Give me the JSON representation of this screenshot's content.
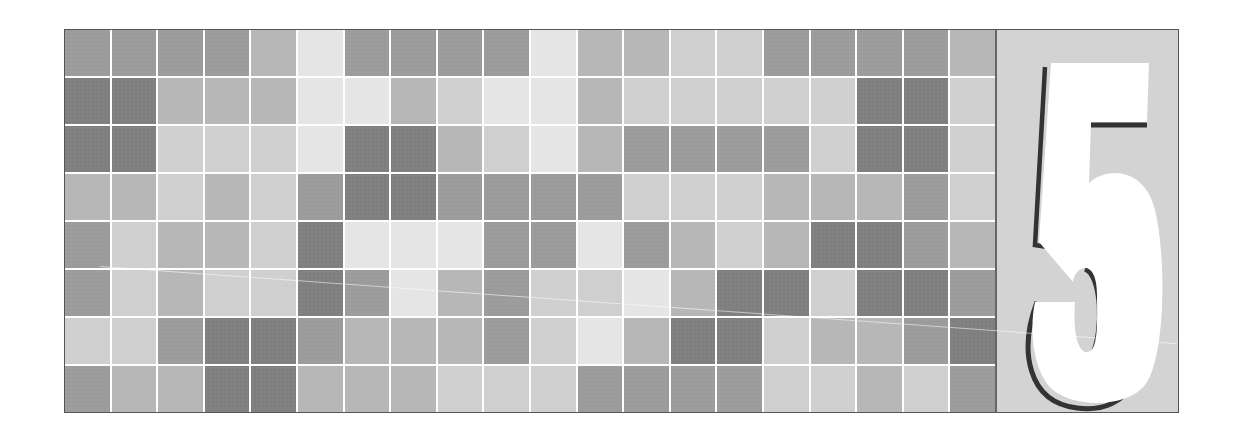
{
  "title_numeral": "5",
  "palette": {
    "D": "#7f7f7f",
    "M": "#9b9b9b",
    "L": "#b6b6b6",
    "V": "#cfcfcf",
    "W": "#e5e5e5",
    "grid_line": "#ffffff",
    "panel_bg": "#d3d3d3",
    "numeral_fill": "#ffffff",
    "numeral_shadow": "#333333",
    "frame_border": "#555555"
  },
  "grid": {
    "columns": 20,
    "rows": 8,
    "cells": [
      [
        "M",
        "M",
        "M",
        "M",
        "L",
        "W",
        "M",
        "M",
        "M",
        "M",
        "W",
        "L",
        "L",
        "V",
        "V",
        "M",
        "M",
        "M",
        "M",
        "L"
      ],
      [
        "D",
        "D",
        "L",
        "L",
        "L",
        "W",
        "W",
        "L",
        "V",
        "W",
        "W",
        "L",
        "V",
        "V",
        "V",
        "V",
        "V",
        "D",
        "D",
        "V"
      ],
      [
        "D",
        "D",
        "V",
        "V",
        "V",
        "W",
        "D",
        "D",
        "L",
        "V",
        "W",
        "L",
        "M",
        "M",
        "M",
        "M",
        "V",
        "D",
        "D",
        "V"
      ],
      [
        "L",
        "L",
        "V",
        "L",
        "V",
        "M",
        "D",
        "D",
        "M",
        "M",
        "M",
        "M",
        "V",
        "V",
        "V",
        "L",
        "L",
        "L",
        "M",
        "V"
      ],
      [
        "M",
        "V",
        "L",
        "L",
        "V",
        "D",
        "W",
        "W",
        "W",
        "M",
        "M",
        "W",
        "M",
        "L",
        "V",
        "L",
        "D",
        "D",
        "M",
        "L"
      ],
      [
        "M",
        "V",
        "L",
        "V",
        "V",
        "D",
        "M",
        "W",
        "L",
        "M",
        "V",
        "V",
        "W",
        "L",
        "D",
        "D",
        "V",
        "D",
        "D",
        "M"
      ],
      [
        "V",
        "V",
        "M",
        "D",
        "D",
        "M",
        "L",
        "L",
        "L",
        "M",
        "V",
        "W",
        "L",
        "D",
        "D",
        "V",
        "L",
        "L",
        "M",
        "D"
      ],
      [
        "M",
        "L",
        "L",
        "D",
        "D",
        "L",
        "L",
        "L",
        "V",
        "V",
        "V",
        "M",
        "M",
        "M",
        "M",
        "V",
        "V",
        "L",
        "V",
        "M"
      ]
    ]
  }
}
